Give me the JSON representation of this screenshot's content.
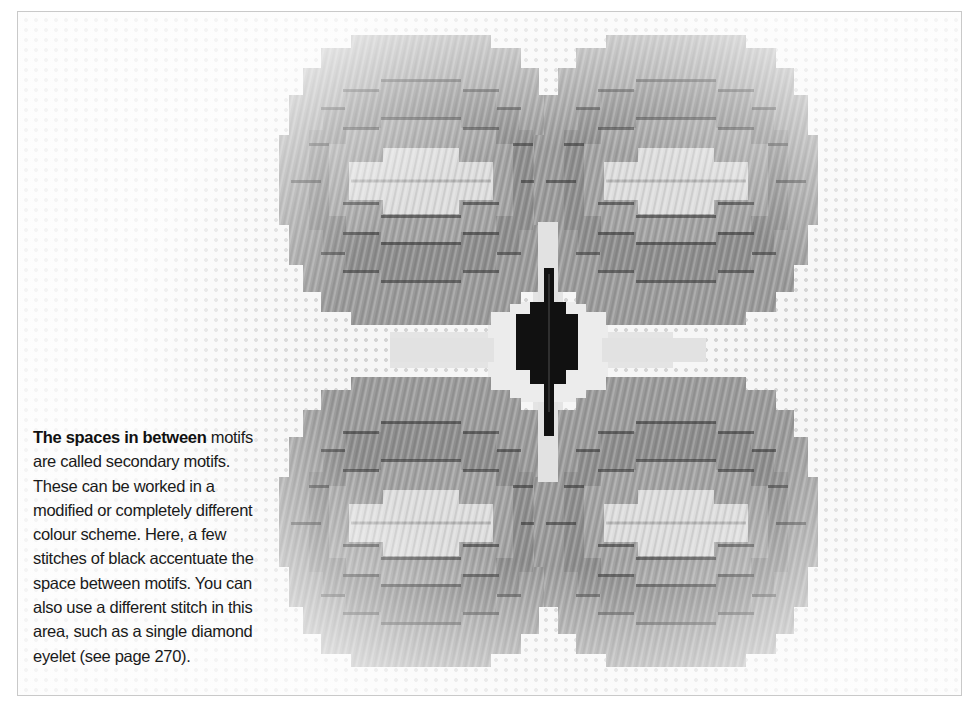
{
  "figure": {
    "colors": {
      "motif_outer": "#9b9b9b",
      "motif_band": "#8c8c8c",
      "motif_center": "#dedede",
      "secondary_motif_light": "#e6e6e6",
      "secondary_motif_black": "#111111",
      "canvas_background": "#f6f6f6",
      "frame_border": "#c9c9c9"
    },
    "motifs": [
      {
        "name": "top-left-motif",
        "cx": 403,
        "cy": 174
      },
      {
        "name": "top-right-motif",
        "cx": 658,
        "cy": 174
      },
      {
        "name": "bottom-left-motif",
        "cx": 403,
        "cy": 514
      },
      {
        "name": "bottom-right-motif",
        "cx": 658,
        "cy": 514
      }
    ]
  },
  "caption": {
    "lead": "The spaces in between",
    "text": " motifs are called secondary motifs. These can be worked in a modified or completely different colour scheme. Here, a few stitches of black accentuate the space between motifs. You can also use a different stitch in this area, such as a single diamond eyelet (see page 270)."
  }
}
